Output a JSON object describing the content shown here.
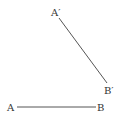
{
  "diagram": {
    "type": "geometry-segments",
    "line_color": "#555555",
    "label_color": "#333333",
    "points": {
      "A": {
        "label": "A",
        "x": 17,
        "y": 107
      },
      "B": {
        "label": "B",
        "x": 96,
        "y": 107
      },
      "A_prime": {
        "label": "A′",
        "x": 59,
        "y": 18
      },
      "B_prime": {
        "label": "B′",
        "x": 107,
        "y": 83
      }
    },
    "segments": [
      {
        "from": "A",
        "to": "B"
      },
      {
        "from": "A_prime",
        "to": "B_prime"
      }
    ]
  }
}
